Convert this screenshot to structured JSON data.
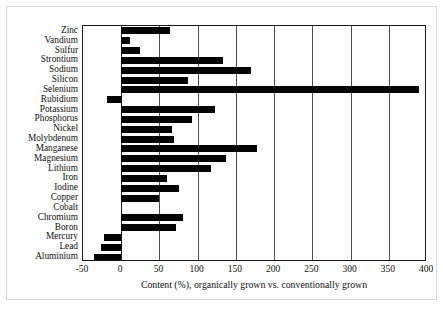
{
  "chart_data": {
    "type": "bar",
    "orientation": "horizontal",
    "title": "",
    "xlabel": "Content (%), organically grown vs. conventionally grown",
    "ylabel": "",
    "xlim": [
      -50,
      400
    ],
    "xticks": [
      -50,
      0,
      50,
      100,
      150,
      200,
      250,
      300,
      350,
      400
    ],
    "xtick_labels": [
      "-50",
      "0",
      "50",
      "100",
      "150",
      "200",
      "250",
      "300",
      "350",
      "400"
    ],
    "grid": true,
    "grid_axis": "x",
    "legend": "none",
    "bar_color": "#000000",
    "categories": [
      "Zinc",
      "Vandium",
      "Sulfur",
      "Strontium",
      "Sodium",
      "Silicon",
      "Selenium",
      "Rubidium",
      "Potassium",
      "Phosphorus",
      "Nickel",
      "Molybdenum",
      "Manganese",
      "Magnesium",
      "Lithium",
      "Iron",
      "Iodine",
      "Copper",
      "Cobalt",
      "Chromium",
      "Boron",
      "Mercury",
      "Lead",
      "Aluminium"
    ],
    "values": [
      64,
      11,
      24,
      133,
      170,
      88,
      390,
      -18,
      123,
      92,
      67,
      69,
      178,
      137,
      118,
      60,
      75,
      49,
      0,
      81,
      72,
      -22,
      -27,
      -36
    ]
  }
}
